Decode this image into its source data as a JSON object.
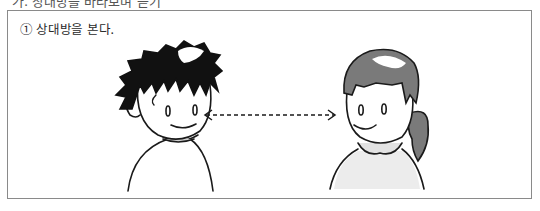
{
  "header": {
    "cut_text": "가. 상대방을 바라보며 듣기"
  },
  "panel": {
    "caption": "① 상대방을 본다."
  },
  "illustration": {
    "boy": "boy-figure",
    "girl": "girl-figure",
    "arrow": "dashed-double-arrow",
    "colors": {
      "line": "#1a1a1a",
      "boy_hair": "#111111",
      "girl_hair": "#7a7a7a",
      "frame": "#8a8a8a"
    }
  }
}
